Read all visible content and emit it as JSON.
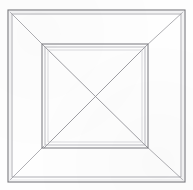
{
  "figure": {
    "title": "Nested square frame perspective line drawing",
    "medium": "pencil line drawing on off-white paper",
    "width_px": 193,
    "height_px": 190
  },
  "colors": {
    "background": "#fefefe",
    "paper": "#fbfbfa",
    "line_dark": "#6e6e72",
    "line_mid": "#8e8e94",
    "line_light": "#b4b4ba",
    "line_faint": "#cfcfd4"
  },
  "geometry": {
    "outer_rect_outer": {
      "x": 8,
      "y": 10,
      "w": 177,
      "h": 172
    },
    "outer_rect_inner": {
      "x": 12,
      "y": 14,
      "w": 169,
      "h": 163
    },
    "inner_rect_outer": {
      "x": 42,
      "y": 44,
      "w": 106,
      "h": 104
    },
    "inner_rect_mid": {
      "x": 45,
      "y": 47,
      "w": 100,
      "h": 98
    },
    "inner_rect_inner": {
      "x": 48,
      "y": 50,
      "w": 94,
      "h": 92
    },
    "center": {
      "x": 96,
      "y": 97
    }
  },
  "elements": {
    "outer_frame_label": "outer square border",
    "inner_frame_label": "inner square panel",
    "corner_diagonals_label": "corner receding diagonals",
    "cross_diagonals_label": "inner panel crossing diagonals"
  },
  "chart_data": {
    "type": "line",
    "title": "Nested square frame perspective line drawing",
    "xlabel": "",
    "ylabel": "",
    "xlim": [
      0,
      193
    ],
    "ylim": [
      0,
      190
    ],
    "grid": false,
    "legend": "none",
    "series": [
      {
        "name": "outer-square-outer-edge",
        "closed": true,
        "points": [
          [
            8,
            10
          ],
          [
            185,
            10
          ],
          [
            185,
            182
          ],
          [
            8,
            182
          ]
        ]
      },
      {
        "name": "outer-square-inner-edge",
        "closed": true,
        "points": [
          [
            12,
            14
          ],
          [
            181,
            14
          ],
          [
            181,
            177
          ],
          [
            12,
            177
          ]
        ]
      },
      {
        "name": "inner-square-outer-edge",
        "closed": true,
        "points": [
          [
            42,
            44
          ],
          [
            148,
            44
          ],
          [
            148,
            148
          ],
          [
            42,
            148
          ]
        ]
      },
      {
        "name": "inner-square-mid-edge",
        "closed": true,
        "points": [
          [
            45,
            47
          ],
          [
            145,
            47
          ],
          [
            145,
            145
          ],
          [
            45,
            145
          ]
        ]
      },
      {
        "name": "inner-square-inner-edge",
        "closed": true,
        "points": [
          [
            48,
            50
          ],
          [
            142,
            50
          ],
          [
            142,
            142
          ],
          [
            48,
            142
          ]
        ]
      },
      {
        "name": "corner-diagonal-top-left",
        "closed": false,
        "points": [
          [
            10,
            12
          ],
          [
            44,
            46
          ]
        ]
      },
      {
        "name": "corner-diagonal-top-right",
        "closed": false,
        "points": [
          [
            183,
            12
          ],
          [
            146,
            46
          ]
        ]
      },
      {
        "name": "corner-diagonal-bottom-right",
        "closed": false,
        "points": [
          [
            183,
            180
          ],
          [
            146,
            146
          ]
        ]
      },
      {
        "name": "corner-diagonal-bottom-left",
        "closed": false,
        "points": [
          [
            10,
            180
          ],
          [
            44,
            146
          ]
        ]
      },
      {
        "name": "cross-diagonal-nw-se",
        "closed": false,
        "points": [
          [
            44,
            46
          ],
          [
            148,
            148
          ]
        ]
      },
      {
        "name": "cross-diagonal-ne-sw",
        "closed": false,
        "points": [
          [
            146,
            46
          ],
          [
            44,
            148
          ]
        ]
      }
    ]
  }
}
